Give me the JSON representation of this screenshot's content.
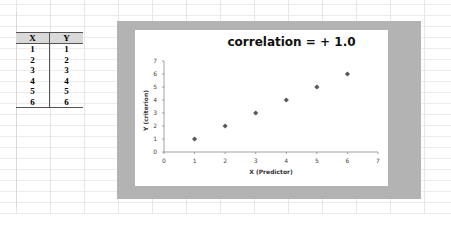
{
  "table": {
    "headers": [
      "X",
      "Y"
    ],
    "rows": [
      [
        "1",
        "1"
      ],
      [
        "2",
        "2"
      ],
      [
        "3",
        "3"
      ],
      [
        "4",
        "4"
      ],
      [
        "5",
        "5"
      ],
      [
        "6",
        "6"
      ]
    ]
  },
  "chart": {
    "title": "correlation  =  + 1.0",
    "xlabel": "X (Predictor)",
    "ylabel": "Y (criterion)",
    "marker_color": "#595959"
  },
  "chart_data": {
    "type": "scatter",
    "title": "correlation = + 1.0",
    "xlabel": "X (Predictor)",
    "ylabel": "Y (criterion)",
    "x": [
      1,
      2,
      3,
      4,
      5,
      6
    ],
    "y": [
      1,
      2,
      3,
      4,
      5,
      6
    ],
    "xlim": [
      0,
      7
    ],
    "ylim": [
      0,
      7
    ],
    "xticks": [
      0,
      1,
      2,
      3,
      4,
      5,
      6,
      7
    ],
    "yticks": [
      0,
      1,
      2,
      3,
      4,
      5,
      6,
      7
    ],
    "grid": false,
    "legend": null,
    "marker": "diamond"
  }
}
